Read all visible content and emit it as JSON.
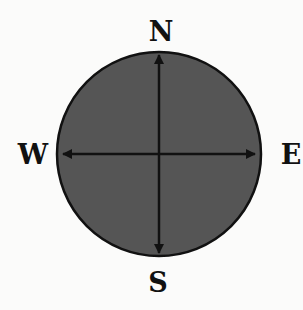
{
  "diagram": {
    "type": "compass-rose",
    "labels": {
      "north": "N",
      "south": "S",
      "east": "E",
      "west": "W"
    },
    "colors": {
      "background": "#fbfbfa",
      "disc_fill": "#555555",
      "stroke": "#111111",
      "label": "#111111"
    }
  }
}
